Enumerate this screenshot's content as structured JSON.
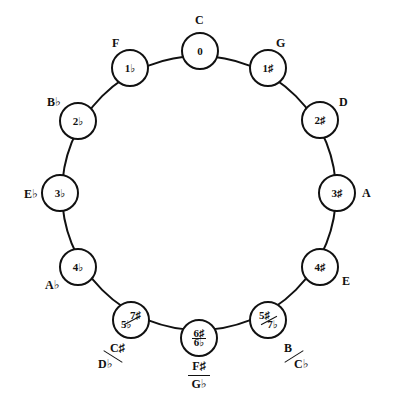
{
  "diagram": {
    "nodes": [
      {
        "key": "C",
        "signature": "0"
      },
      {
        "key": "G",
        "signature": "1♯"
      },
      {
        "key": "D",
        "signature": "2♯"
      },
      {
        "key": "A",
        "signature": "3♯"
      },
      {
        "key": "E",
        "signature": "4♯"
      },
      {
        "key_top": "B",
        "key_bottom": "C♭",
        "sig_top": "5♯",
        "sig_bottom": "7♭"
      },
      {
        "key_top": "F♯",
        "key_bottom": "G♭",
        "sig_top": "6♯",
        "sig_bottom": "6♭"
      },
      {
        "key_top": "C♯",
        "key_bottom": "D♭",
        "sig_top": "7♯",
        "sig_bottom": "5♭"
      },
      {
        "key": "A♭",
        "signature": "4♭"
      },
      {
        "key": "E♭",
        "signature": "3♭"
      },
      {
        "key": "B♭",
        "signature": "2♭"
      },
      {
        "key": "F",
        "signature": "1♭"
      }
    ]
  }
}
